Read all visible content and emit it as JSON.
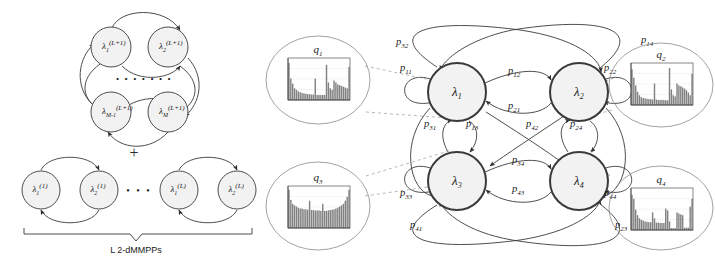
{
  "figure": {
    "background": "#ffffff",
    "stroke": "#3a3a3a",
    "node_fill": "#f2f2f2",
    "hist_bar_color": "#6b6b6b"
  },
  "left_panel": {
    "name": "superposition-of-dMMPPs",
    "top_cluster": {
      "caption": "",
      "nodes": [
        {
          "id": "n1",
          "base": "λ",
          "sub": "1",
          "sup": "(L+1)",
          "cx": 111,
          "cy": 47,
          "r": 20
        },
        {
          "id": "n2",
          "base": "λ",
          "sub": "2",
          "sup": "(L+1)",
          "cx": 168,
          "cy": 47,
          "r": 20
        },
        {
          "id": "n3",
          "base": "λ",
          "sub": "M-1",
          "sup": "(L+1)",
          "cx": 111,
          "cy": 112,
          "r": 20
        },
        {
          "id": "n4",
          "base": "λ",
          "sub": "M",
          "sup": "(L+1)",
          "cx": 168,
          "cy": 112,
          "r": 20
        }
      ],
      "ellipsis": "• • • • • • •"
    },
    "plus_symbol": "+",
    "bottom_cluster": {
      "nodes": [
        {
          "id": "b1",
          "base": "λ",
          "sub": "1",
          "sup": "(1)",
          "cx": 41,
          "cy": 190,
          "r": 19
        },
        {
          "id": "b2",
          "base": "λ",
          "sub": "2",
          "sup": "(1)",
          "cx": 99,
          "cy": 190,
          "r": 19
        },
        {
          "id": "b3",
          "base": "λ",
          "sub": "1",
          "sup": "(L)",
          "cx": 179,
          "cy": 190,
          "r": 19
        },
        {
          "id": "b4",
          "base": "λ",
          "sub": "2",
          "sup": "(L)",
          "cx": 237,
          "cy": 190,
          "r": 19
        }
      ],
      "ellipsis": "• • •",
      "brace_label": "L 2-dMMPPs"
    }
  },
  "right_panel": {
    "name": "four-state-dmmpp-chain",
    "states": [
      {
        "id": "s1",
        "base": "λ",
        "sub": "1",
        "cx": 457,
        "cy": 92,
        "r": 29
      },
      {
        "id": "s2",
        "base": "λ",
        "sub": "2",
        "cx": 579,
        "cy": 92,
        "r": 29
      },
      {
        "id": "s3",
        "base": "λ",
        "sub": "3",
        "cx": 457,
        "cy": 181,
        "r": 29
      },
      {
        "id": "s4",
        "base": "λ",
        "sub": "4",
        "cx": 579,
        "cy": 181,
        "r": 29
      }
    ],
    "transitions": [
      {
        "id": "p32",
        "base": "p",
        "sub": "32",
        "x": 396,
        "y": 45
      },
      {
        "id": "p14",
        "base": "p",
        "sub": "14",
        "x": 641,
        "y": 43
      },
      {
        "id": "p11",
        "base": "p",
        "sub": "11",
        "x": 400,
        "y": 71
      },
      {
        "id": "p22",
        "base": "p",
        "sub": "22",
        "x": 604,
        "y": 71
      },
      {
        "id": "p12",
        "base": "p",
        "sub": "12",
        "x": 508,
        "y": 74
      },
      {
        "id": "p21",
        "base": "p",
        "sub": "21",
        "x": 508,
        "y": 109
      },
      {
        "id": "p31",
        "base": "p",
        "sub": "31",
        "x": 424,
        "y": 127
      },
      {
        "id": "p13",
        "base": "p",
        "sub": "13",
        "x": 466,
        "y": 127
      },
      {
        "id": "p42",
        "base": "p",
        "sub": "42",
        "x": 526,
        "y": 127
      },
      {
        "id": "p24",
        "base": "p",
        "sub": "24",
        "x": 570,
        "y": 127
      },
      {
        "id": "p34",
        "base": "p",
        "sub": "34",
        "x": 512,
        "y": 163
      },
      {
        "id": "p43",
        "base": "p",
        "sub": "43",
        "x": 512,
        "y": 192
      },
      {
        "id": "p33",
        "base": "p",
        "sub": "33",
        "x": 400,
        "y": 196
      },
      {
        "id": "p44",
        "base": "p",
        "sub": "44",
        "x": 604,
        "y": 196
      },
      {
        "id": "p41",
        "base": "p",
        "sub": "41",
        "x": 410,
        "y": 228
      },
      {
        "id": "p23",
        "base": "p",
        "sub": "23",
        "x": 615,
        "y": 228
      }
    ]
  },
  "histograms": [
    {
      "id": "q1",
      "label": "q",
      "sub": "1",
      "cx": 318,
      "cy": 80,
      "ellipse_rx": 52,
      "ellipse_ry": 44,
      "plot": {
        "x": 288,
        "y": 58,
        "w": 62,
        "h": 42
      },
      "values": [
        0.95,
        0.55,
        0.42,
        0.3,
        0.26,
        0.22,
        0.2,
        0.18,
        0.17,
        0.16,
        0.15,
        0.15,
        0.14,
        0.14,
        0.55,
        0.13,
        0.13,
        0.13,
        0.13,
        0.13,
        0.9,
        0.45,
        0.3,
        0.26,
        0.5,
        0.45,
        0.4,
        0.38,
        0.36,
        0.34,
        0.32,
        0.3,
        0.85
      ]
    },
    {
      "id": "q2",
      "label": "q",
      "sub": "2",
      "cx": 661,
      "cy": 85,
      "ellipse_rx": 52,
      "ellipse_ry": 42,
      "plot": {
        "x": 631,
        "y": 63,
        "w": 62,
        "h": 42
      },
      "values": [
        0.92,
        0.7,
        0.5,
        0.34,
        0.25,
        0.2,
        0.18,
        0.17,
        0.16,
        0.15,
        0.15,
        0.14,
        0.55,
        0.14,
        0.13,
        0.13,
        0.13,
        0.13,
        0.12,
        0.12,
        0.95,
        0.4,
        0.25,
        0.22,
        0.55,
        0.5,
        0.48,
        0.45,
        0.42,
        0.38,
        0.32,
        0.25,
        0.8
      ]
    },
    {
      "id": "q3",
      "label": "q",
      "sub": "3",
      "cx": 318,
      "cy": 206,
      "ellipse_rx": 52,
      "ellipse_ry": 44,
      "plot": {
        "x": 288,
        "y": 186,
        "w": 62,
        "h": 42
      },
      "values": [
        0.98,
        0.72,
        0.62,
        0.58,
        0.55,
        0.52,
        0.5,
        0.5,
        0.48,
        0.48,
        0.47,
        0.7,
        0.46,
        0.46,
        0.45,
        0.45,
        0.45,
        0.44,
        0.62,
        0.44,
        0.44,
        0.45,
        0.46,
        0.47,
        0.48,
        0.5,
        0.52,
        0.55,
        0.58,
        0.62,
        0.7,
        0.8,
        0.98
      ]
    },
    {
      "id": "q4",
      "label": "q",
      "sub": "4",
      "cx": 661,
      "cy": 208,
      "ellipse_rx": 52,
      "ellipse_ry": 42,
      "plot": {
        "x": 631,
        "y": 188,
        "w": 62,
        "h": 42
      },
      "values": [
        0.9,
        0.8,
        0.52,
        0.38,
        0.3,
        0.26,
        0.24,
        0.22,
        0.21,
        0.2,
        0.2,
        0.45,
        0.3,
        0.19,
        0.19,
        0.18,
        0.18,
        0.18,
        0.55,
        0.5,
        0.22,
        0.05,
        0.05,
        0.05,
        0.45,
        0.42,
        0.4,
        0.38,
        0.06,
        0.06,
        0.06,
        0.6,
        0.8
      ]
    }
  ]
}
